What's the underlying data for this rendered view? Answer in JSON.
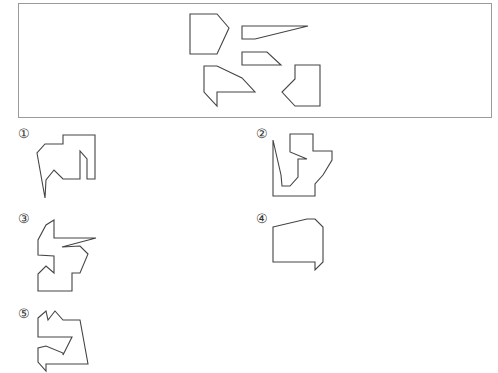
{
  "puzzle": {
    "description": "Which figure can be assembled from the five given pieces?",
    "pieces": [
      {
        "name": "pentagon",
        "points": "190,14 217,14 229,28 217,54 190,54"
      },
      {
        "name": "wedge",
        "points": "242,26 308,26 255,39 242,39"
      },
      {
        "name": "trapezoid",
        "points": "242,52 267,52 281,65 242,65"
      },
      {
        "name": "arrow",
        "points": "204,66 217,66 242,78 255,92 217,92 217,106 204,92"
      },
      {
        "name": "notched-rect",
        "points": "295,65 320,65 320,106 295,106 282,92 295,79"
      }
    ],
    "options": [
      {
        "label": "①",
        "x": 18,
        "y": 127,
        "points": "63,135 95,135 95,179 87,179 87,159 80,151 80,179 63,179 54,170 46,180 45,198 37,153 45,144 63,144"
      },
      {
        "label": "②",
        "x": 256,
        "y": 127,
        "points": "290,134 313,134 313,151 332,151 332,160 323,175 315,184 315,196 273,196 273,140 281,175 282,186 290,186 298,177 298,159 307,159 290,152"
      },
      {
        "label": "③",
        "x": 18,
        "y": 212,
        "points": "54,220 54,238 96,238 62,247 80,246 88,254 80,273 72,273 72,291 38,291 38,274 46,266 54,273 54,256 38,255 38,240 46,225"
      },
      {
        "label": "④",
        "x": 256,
        "y": 212,
        "points": "273,227 307,219 315,219 323,227 323,262 315,270 315,262 273,262"
      },
      {
        "label": "⑤",
        "x": 18,
        "y": 307,
        "points": "38,318 46,311 48,320 55,311 63,320 80,320 88,364 46,364 46,371 38,362 38,348 46,346 63,353 63,355 72,337 38,337"
      }
    ]
  }
}
